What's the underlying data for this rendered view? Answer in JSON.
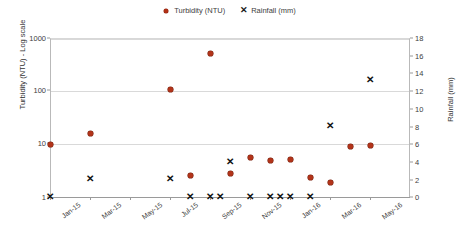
{
  "chart_data": {
    "type": "scatter",
    "title": "",
    "xlabel": "",
    "ylabel": "Turbidity (NTU) - Log scale",
    "y2label": "Rainfall (mm)",
    "grid": true,
    "legend_position": "top-center",
    "x_tick_labels": [
      "Jan-15",
      "Mar-15",
      "May-15",
      "Jul-15",
      "Sep-15",
      "Nov-15",
      "Jan-16",
      "Mar-16",
      "May-16"
    ],
    "y_left_scale": "log",
    "y_left_ticks": [
      "1",
      "10",
      "100",
      "1000"
    ],
    "ylim_left": [
      1,
      1000
    ],
    "y_right_scale": "linear",
    "y_right_ticks": [
      "0",
      "2",
      "4",
      "6",
      "8",
      "10",
      "12",
      "14",
      "16",
      "18"
    ],
    "ylim_right": [
      0,
      18
    ],
    "xlim_months": [
      "Jan-15",
      "Jun-16"
    ],
    "series": [
      {
        "name": "Turbidity (NTU)",
        "axis": "left",
        "marker": "diamond",
        "color": "#b3341a",
        "points": [
          {
            "x": "Jan-15",
            "y": 10
          },
          {
            "x": "Mar-15",
            "y": 16
          },
          {
            "x": "Jul-15",
            "y": 105
          },
          {
            "x": "Aug-15",
            "y": 2.6
          },
          {
            "x": "Sep-15",
            "y": 500
          },
          {
            "x": "Oct-15",
            "y": 2.8
          },
          {
            "x": "Nov-15",
            "y": 5.5
          },
          {
            "x": "Dec-15",
            "y": 4.8
          },
          {
            "x": "Jan-16",
            "y": 5.2
          },
          {
            "x": "Feb-16",
            "y": 2.3
          },
          {
            "x": "Mar-16",
            "y": 1.9
          },
          {
            "x": "Apr-16",
            "y": 9.0
          },
          {
            "x": "May-16",
            "y": 9.5
          }
        ]
      },
      {
        "name": "Rainfall (mm)",
        "axis": "right",
        "marker": "cross",
        "color": "#121212",
        "points": [
          {
            "x": "Jan-15",
            "y": 0
          },
          {
            "x": "Mar-15",
            "y": 2
          },
          {
            "x": "Jul-15",
            "y": 2
          },
          {
            "x": "Aug-15",
            "y": 0
          },
          {
            "x": "Sep-15",
            "y": 0
          },
          {
            "x": "Sep-15b",
            "y": 0
          },
          {
            "x": "Oct-15",
            "y": 4
          },
          {
            "x": "Nov-15",
            "y": 0
          },
          {
            "x": "Dec-15",
            "y": 0
          },
          {
            "x": "Dec-15b",
            "y": 0
          },
          {
            "x": "Jan-16",
            "y": 0
          },
          {
            "x": "Feb-16",
            "y": 0
          },
          {
            "x": "Mar-16",
            "y": 8
          },
          {
            "x": "May-16",
            "y": 13.3
          }
        ]
      }
    ]
  },
  "legend": {
    "entries": [
      {
        "label": "Turbidity (NTU)",
        "marker": "diamond-marker-icon"
      },
      {
        "label": "Rainfall (mm)",
        "marker": "cross-marker-icon"
      }
    ]
  },
  "axes": {
    "left_title": "Turbidity (NTU) - Log scale",
    "right_title": "Rainfall (mm)"
  },
  "colors": {
    "turbidity": "#b3341a",
    "rainfall": "#121212",
    "grid": "#d9d9d9",
    "axis": "#9a9a9a"
  }
}
